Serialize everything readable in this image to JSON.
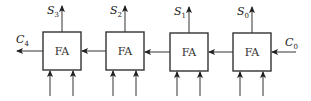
{
  "diagram": {
    "type": "ripple-carry-adder",
    "blocks": [
      {
        "label": "FA",
        "sum": {
          "base": "S",
          "sub": "3"
        }
      },
      {
        "label": "FA",
        "sum": {
          "base": "S",
          "sub": "2"
        }
      },
      {
        "label": "FA",
        "sum": {
          "base": "S",
          "sub": "1"
        }
      },
      {
        "label": "FA",
        "sum": {
          "base": "S",
          "sub": "0"
        }
      }
    ],
    "carry_out": {
      "base": "C",
      "sub": "4"
    },
    "carry_in": {
      "base": "C",
      "sub": "0"
    }
  }
}
